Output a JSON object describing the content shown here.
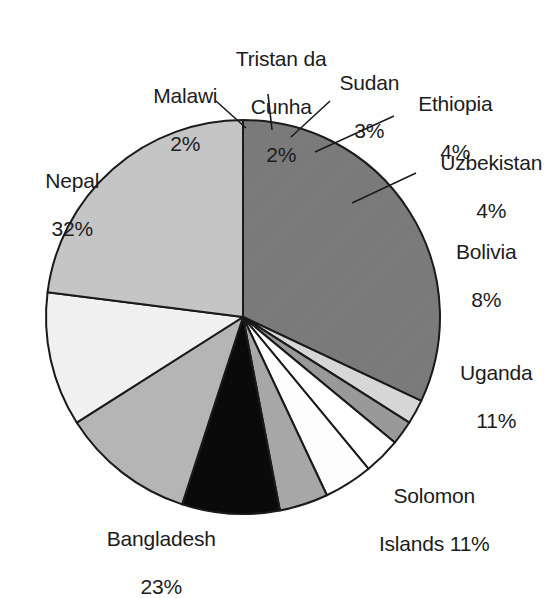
{
  "chart_data": {
    "type": "pie",
    "title": "",
    "categories": [
      "Nepal",
      "Malawi",
      "Tristan da Cunha",
      "Sudan",
      "Ethiopia",
      "Uzbekistan",
      "Bolivia",
      "Uganda",
      "Solomon Islands",
      "Bangladesh"
    ],
    "values": [
      32,
      2,
      2,
      3,
      4,
      4,
      8,
      11,
      11,
      23
    ],
    "unit": "%",
    "total": 100,
    "legend": "none",
    "grid": false,
    "start_angle_deg": 0,
    "direction": "clockwise",
    "slice_colors": [
      "#7b7b7b",
      "#d8d8d8",
      "#9a9a9a",
      "#ffffff",
      "#fdfdfd",
      "#a8a8a8",
      "#0a0a0a",
      "#b6b6b6",
      "#f2f2f2",
      "#c6c6c6"
    ],
    "slices": [
      {
        "name": "Nepal",
        "value": 32,
        "label": "Nepal",
        "percent_text": "32%",
        "color": "#7b7b7b"
      },
      {
        "name": "Malawi",
        "value": 2,
        "label": "Malawi",
        "percent_text": "2%",
        "color": "#d8d8d8"
      },
      {
        "name": "Tristan da Cunha",
        "value": 2,
        "label": "Tristan da Cunha",
        "percent_text": "2%",
        "color": "#9a9a9a"
      },
      {
        "name": "Sudan",
        "value": 3,
        "label": "Sudan",
        "percent_text": "3%",
        "color": "#ffffff"
      },
      {
        "name": "Ethiopia",
        "value": 4,
        "label": "Ethiopia",
        "percent_text": "4%",
        "color": "#fdfdfd"
      },
      {
        "name": "Uzbekistan",
        "value": 4,
        "label": "Uzbekistan",
        "percent_text": "4%",
        "color": "#a8a8a8"
      },
      {
        "name": "Bolivia",
        "value": 8,
        "label": "Bolivia",
        "percent_text": "8%",
        "color": "#0a0a0a"
      },
      {
        "name": "Uganda",
        "value": 11,
        "label": "Uganda",
        "percent_text": "11%",
        "color": "#b6b6b6"
      },
      {
        "name": "Solomon Islands",
        "value": 11,
        "label": "Solomon Islands",
        "percent_text": "11%",
        "color": "#f2f2f2"
      },
      {
        "name": "Bangladesh",
        "value": 23,
        "label": "Bangladesh",
        "percent_text": "23%",
        "color": "#c6c6c6"
      }
    ]
  },
  "labels": {
    "malawi_line1": "Malawi",
    "malawi_line2": "2%",
    "tristan_line1": "Tristan da",
    "tristan_line2": "Cunha",
    "tristan_line3": "2%",
    "sudan_line1": "Sudan",
    "sudan_line2": "3%",
    "ethiopia_line1": "Ethiopia",
    "ethiopia_line2": "4%",
    "uzbekistan_line1": "Uzbekistan",
    "uzbekistan_line2": "4%",
    "bolivia_line1": "Bolivia",
    "bolivia_line2": "8%",
    "uganda_line1": "Uganda",
    "uganda_line2": "11%",
    "solomon_line1": "Solomon",
    "solomon_line2": "Islands 11%",
    "bangladesh_line1": "Bangladesh",
    "bangladesh_line2": "23%",
    "nepal_line1": "Nepal",
    "nepal_line2": "32%"
  }
}
